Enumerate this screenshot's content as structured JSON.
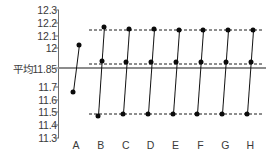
{
  "chart_data": {
    "type": "line",
    "title": "",
    "xlabel": "",
    "ylabel": "",
    "ylim": [
      11.3,
      12.3
    ],
    "grid": false,
    "legend": null,
    "categories": [
      "A",
      "B",
      "C",
      "D",
      "E",
      "F",
      "G",
      "H"
    ],
    "y_ticks": [
      {
        "value": 12.3,
        "label": "12.3"
      },
      {
        "value": 12.2,
        "label": "12.2"
      },
      {
        "value": 12.1,
        "label": "12.1"
      },
      {
        "value": 12.0,
        "label": "12"
      },
      {
        "value": 11.85,
        "label": "平均11.85"
      },
      {
        "value": 11.7,
        "label": "11.7"
      },
      {
        "value": 11.6,
        "label": "11.6"
      },
      {
        "value": 11.5,
        "label": "11.5"
      },
      {
        "value": 11.4,
        "label": "11.4"
      },
      {
        "value": 11.3,
        "label": "11.3"
      }
    ],
    "x_tick_labels": [
      "A",
      "B",
      "C",
      "D",
      "E",
      "F",
      "G",
      "H"
    ],
    "average_line": {
      "value": 11.85,
      "label": "平均11.85",
      "color": "#8c8c8c",
      "style": "solid"
    },
    "reference_lines": [
      {
        "value": 12.14,
        "style": "dash-dot",
        "color": "#1c1c1c",
        "spans_categories": [
          "B",
          "H"
        ]
      },
      {
        "value": 11.88,
        "style": "dash-dot",
        "color": "#1c1c1c",
        "spans_categories": [
          "B",
          "H"
        ]
      },
      {
        "value": 11.49,
        "style": "dash-dot",
        "color": "#1c1c1c",
        "spans_categories": [
          "B",
          "H"
        ]
      }
    ],
    "series": [
      {
        "name": "A",
        "category": "A",
        "points": [
          11.66,
          12.03
        ],
        "point_count": 2
      },
      {
        "name": "B",
        "category": "B",
        "points": [
          11.47,
          11.9,
          12.17
        ],
        "point_count": 3
      },
      {
        "name": "C",
        "category": "C",
        "points": [
          11.49,
          11.89,
          12.15
        ],
        "point_count": 3
      },
      {
        "name": "D",
        "category": "D",
        "points": [
          11.49,
          11.89,
          12.15
        ],
        "point_count": 3
      },
      {
        "name": "E",
        "category": "E",
        "points": [
          11.49,
          11.89,
          12.14
        ],
        "point_count": 3
      },
      {
        "name": "F",
        "category": "F",
        "points": [
          11.49,
          11.89,
          12.14
        ],
        "point_count": 3
      },
      {
        "name": "G",
        "category": "G",
        "points": [
          11.49,
          11.89,
          12.14
        ],
        "point_count": 3
      },
      {
        "name": "H",
        "category": "H",
        "points": [
          11.49,
          11.89,
          12.14
        ],
        "point_count": 3
      }
    ],
    "marker": "filled-circle",
    "line_color": "#111111"
  }
}
